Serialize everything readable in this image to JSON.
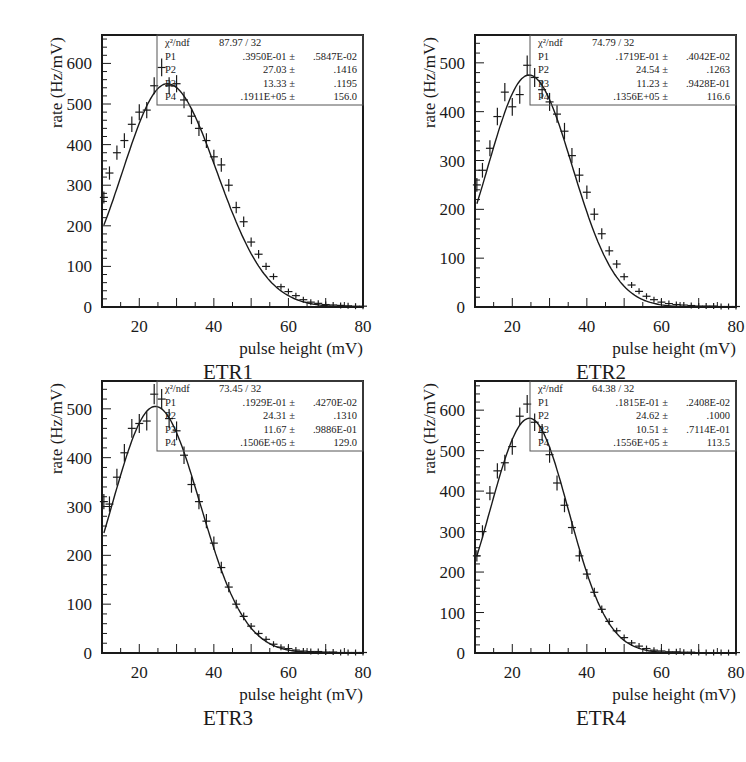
{
  "figure": {
    "x_axis_label": "pulse height (mV)",
    "y_axis_label": "rate (Hz/mV)",
    "line_color": "#1a1a1a",
    "frame_color": "#1a1a1a",
    "stats_box_color": "#555555"
  },
  "chart_data": [
    {
      "type": "scatter",
      "title": "ETR1",
      "xlabel": "pulse height (mV)",
      "ylabel": "rate (Hz/mV)",
      "xlim": [
        10,
        80
      ],
      "ylim": [
        0,
        670
      ],
      "x_ticks": [
        20,
        40,
        60,
        80
      ],
      "y_ticks": [
        0,
        100,
        200,
        300,
        400,
        500,
        600
      ],
      "grid": false,
      "legend": "stats box top-right",
      "stats": {
        "chi2_label": "χ²/ndf",
        "chi2": "87.97",
        "ndf": "32",
        "params": [
          {
            "name": "P1",
            "value": ".3950E-01 ±",
            "error": ".5847E-02"
          },
          {
            "name": "P2",
            "value": "27.03 ±",
            "error": ".1416"
          },
          {
            "name": "P3",
            "value": "13.33 ±",
            "error": ".1195"
          },
          {
            "name": "P4",
            "value": ".1911E+05 ±",
            "error": "156.0"
          }
        ]
      },
      "fit": {
        "peak_x": 27.5,
        "peak_y": 550,
        "sigma_left": 12.0,
        "sigma_right": 13.3,
        "shape": 1.0
      },
      "x": [
        10.5,
        12,
        14,
        16,
        18,
        20,
        22,
        24,
        26,
        28,
        30,
        32,
        34,
        36,
        38,
        40,
        42,
        44,
        46,
        48,
        50,
        52,
        54,
        56,
        58,
        60,
        62,
        64,
        66,
        68,
        70,
        72,
        74,
        76,
        78,
        80
      ],
      "values": [
        270,
        330,
        380,
        410,
        450,
        480,
        485,
        545,
        590,
        545,
        550,
        510,
        470,
        440,
        410,
        370,
        350,
        300,
        245,
        210,
        160,
        130,
        100,
        75,
        50,
        38,
        28,
        18,
        12,
        9,
        6,
        5,
        4,
        3,
        2,
        2
      ]
    },
    {
      "type": "scatter",
      "title": "ETR2",
      "xlabel": "pulse height (mV)",
      "ylabel": "rate (Hz/mV)",
      "xlim": [
        10,
        80
      ],
      "ylim": [
        0,
        557
      ],
      "x_ticks": [
        20,
        40,
        60,
        80
      ],
      "y_ticks": [
        0,
        100,
        200,
        300,
        400,
        500
      ],
      "grid": false,
      "legend": "stats box top-right",
      "stats": {
        "chi2_label": "χ²/ndf",
        "chi2": "74.79",
        "ndf": "32",
        "params": [
          {
            "name": "P1",
            "value": ".1719E-01 ±",
            "error": ".4042E-02"
          },
          {
            "name": "P2",
            "value": "24.54 ±",
            "error": ".1263"
          },
          {
            "name": "P3",
            "value": "11.23 ±",
            "error": ".9428E-01"
          },
          {
            "name": "P4",
            "value": ".1356E+05 ±",
            "error": "116.6"
          }
        ]
      },
      "fit": {
        "peak_x": 24.5,
        "peak_y": 475,
        "sigma_left": 11.0,
        "sigma_right": 11.6,
        "shape": 1.0
      },
      "x": [
        10.5,
        12,
        14,
        16,
        18,
        20,
        22,
        24,
        26,
        28,
        30,
        32,
        34,
        36,
        38,
        40,
        42,
        44,
        46,
        48,
        50,
        52,
        54,
        56,
        58,
        60,
        62,
        64,
        66,
        68,
        70,
        72,
        74,
        76,
        78,
        80
      ],
      "values": [
        250,
        280,
        325,
        390,
        440,
        410,
        435,
        495,
        470,
        445,
        420,
        395,
        360,
        310,
        270,
        235,
        190,
        150,
        115,
        88,
        62,
        45,
        32,
        22,
        15,
        10,
        7,
        5,
        4,
        3,
        2,
        2,
        2,
        1,
        1,
        1
      ]
    },
    {
      "type": "scatter",
      "title": "ETR3",
      "xlabel": "pulse height (mV)",
      "ylabel": "rate (Hz/mV)",
      "xlim": [
        10,
        80
      ],
      "ylim": [
        0,
        557
      ],
      "x_ticks": [
        20,
        40,
        60,
        80
      ],
      "y_ticks": [
        0,
        100,
        200,
        300,
        400,
        500
      ],
      "grid": false,
      "legend": "stats box top-right",
      "stats": {
        "chi2_label": "χ²/ndf",
        "chi2": "73.45",
        "ndf": "32",
        "params": [
          {
            "name": "P1",
            "value": ".1929E-01 ±",
            "error": ".4270E-02"
          },
          {
            "name": "P2",
            "value": "24.31 ±",
            "error": ".1310"
          },
          {
            "name": "P3",
            "value": "11.67 ±",
            "error": ".9886E-01"
          },
          {
            "name": "P4",
            "value": ".1506E+05 ±",
            "error": "129.0"
          }
        ]
      },
      "fit": {
        "peak_x": 24.3,
        "peak_y": 505,
        "sigma_left": 11.5,
        "sigma_right": 12.0,
        "shape": 1.0
      },
      "x": [
        10.5,
        12,
        14,
        16,
        18,
        20,
        22,
        24,
        26,
        28,
        30,
        32,
        34,
        36,
        38,
        40,
        42,
        44,
        46,
        48,
        50,
        52,
        54,
        56,
        58,
        60,
        62,
        64,
        66,
        68,
        70,
        72,
        74,
        76,
        78,
        80
      ],
      "values": [
        310,
        305,
        360,
        410,
        460,
        470,
        475,
        530,
        520,
        480,
        455,
        405,
        345,
        310,
        270,
        225,
        175,
        135,
        100,
        75,
        55,
        40,
        28,
        18,
        12,
        9,
        6,
        4,
        3,
        3,
        2,
        2,
        1,
        1,
        1,
        1
      ]
    },
    {
      "type": "scatter",
      "title": "ETR4",
      "xlabel": "pulse height (mV)",
      "ylabel": "rate (Hz/mV)",
      "xlim": [
        10,
        80
      ],
      "ylim": [
        0,
        672
      ],
      "x_ticks": [
        20,
        40,
        60,
        80
      ],
      "y_ticks": [
        0,
        100,
        200,
        300,
        400,
        500,
        600
      ],
      "grid": false,
      "legend": "stats box top-right",
      "stats": {
        "chi2_label": "χ²/ndf",
        "chi2": "64.38",
        "ndf": "32",
        "params": [
          {
            "name": "P1",
            "value": ".1815E-01 ±",
            "error": ".2408E-02"
          },
          {
            "name": "P2",
            "value": "24.62 ±",
            "error": ".1000"
          },
          {
            "name": "P3",
            "value": "10.51 ±",
            "error": ".7114E-01"
          },
          {
            "name": "P4",
            "value": ".1556E+05 ±",
            "error": "113.5"
          }
        ]
      },
      "fit": {
        "peak_x": 24.6,
        "peak_y": 580,
        "sigma_left": 10.6,
        "sigma_right": 10.5,
        "shape": 1.0
      },
      "x": [
        10.5,
        12,
        14,
        16,
        18,
        20,
        22,
        24,
        26,
        28,
        30,
        32,
        34,
        36,
        38,
        40,
        42,
        44,
        46,
        48,
        50,
        52,
        54,
        56,
        58,
        60,
        62,
        64,
        66,
        68,
        70,
        72,
        74,
        76,
        78,
        80
      ],
      "values": [
        240,
        300,
        395,
        450,
        470,
        510,
        585,
        615,
        570,
        545,
        490,
        420,
        365,
        310,
        240,
        195,
        150,
        108,
        78,
        55,
        38,
        25,
        17,
        11,
        7,
        5,
        3,
        3,
        2,
        2,
        1,
        1,
        1,
        1,
        1,
        1
      ]
    }
  ]
}
